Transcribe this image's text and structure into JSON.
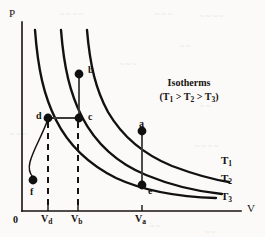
{
  "figure": {
    "axes": {
      "x_label": "V",
      "y_label": "P",
      "origin_label": "0"
    },
    "legend": {
      "title": "Isotherms",
      "relation_prefix": "(T",
      "relation": "(T1 > T2 > T3)",
      "parts": {
        "open": "(T",
        "s1": "1",
        "gt1": " > T",
        "s2": "2",
        "gt2": " > T",
        "s3": "3",
        "close": ")"
      }
    },
    "curve_labels": [
      {
        "base": "T",
        "sub": "1"
      },
      {
        "base": "T",
        "sub": "2"
      },
      {
        "base": "T",
        "sub": "3"
      }
    ],
    "x_ticks": [
      {
        "base": "V",
        "sub": "d"
      },
      {
        "base": "V",
        "sub": "b"
      },
      {
        "base": "V",
        "sub": "a"
      }
    ],
    "points": [
      {
        "id": "a",
        "label": "a"
      },
      {
        "id": "b",
        "label": "b"
      },
      {
        "id": "c",
        "label": "c"
      },
      {
        "id": "d",
        "label": "d"
      },
      {
        "id": "e",
        "label": "e"
      },
      {
        "id": "f",
        "label": "f"
      }
    ],
    "colors": {
      "ink": "#16120f",
      "curve": "#111111",
      "connector": "#444444",
      "background": "#fbfaf8"
    }
  },
  "chart_data": {
    "type": "line",
    "title": "Isotherms",
    "xlabel": "V",
    "ylabel": "P",
    "grid": false,
    "legend_position": "upper-right",
    "annotation": "(T1 > T2 > T3)",
    "xlim": [
      0,
      1
    ],
    "ylim": [
      0,
      1
    ],
    "axis_ticks": {
      "x": [
        "Vd",
        "Vb",
        "Va"
      ],
      "y": []
    },
    "series": [
      {
        "name": "T1",
        "note": "highest isotherm, PV = const (largest constant)",
        "points": [
          {
            "x": 0.295,
            "y": 0.975
          },
          {
            "x": 0.315,
            "y": 0.8
          },
          {
            "x": 0.345,
            "y": 0.69
          },
          {
            "x": 0.4,
            "y": 0.56
          },
          {
            "x": 0.48,
            "y": 0.45
          },
          {
            "x": 0.56,
            "y": 0.38
          },
          {
            "x": 0.66,
            "y": 0.32
          },
          {
            "x": 0.78,
            "y": 0.27
          },
          {
            "x": 0.9,
            "y": 0.24
          },
          {
            "x": 1.0,
            "y": 0.225
          }
        ]
      },
      {
        "name": "T2",
        "note": "middle isotherm",
        "points": [
          {
            "x": 0.175,
            "y": 0.975
          },
          {
            "x": 0.195,
            "y": 0.79
          },
          {
            "x": 0.23,
            "y": 0.64
          },
          {
            "x": 0.28,
            "y": 0.52
          },
          {
            "x": 0.36,
            "y": 0.4
          },
          {
            "x": 0.46,
            "y": 0.31
          },
          {
            "x": 0.58,
            "y": 0.24
          },
          {
            "x": 0.72,
            "y": 0.185
          },
          {
            "x": 0.87,
            "y": 0.15
          },
          {
            "x": 1.0,
            "y": 0.135
          }
        ]
      },
      {
        "name": "T3",
        "note": "lowest isotherm",
        "points": [
          {
            "x": 0.06,
            "y": 0.975
          },
          {
            "x": 0.08,
            "y": 0.76
          },
          {
            "x": 0.11,
            "y": 0.6
          },
          {
            "x": 0.16,
            "y": 0.46
          },
          {
            "x": 0.24,
            "y": 0.33
          },
          {
            "x": 0.34,
            "y": 0.23
          },
          {
            "x": 0.47,
            "y": 0.16
          },
          {
            "x": 0.64,
            "y": 0.11
          },
          {
            "x": 0.82,
            "y": 0.085
          },
          {
            "x": 1.0,
            "y": 0.075
          }
        ]
      }
    ],
    "marked_points": [
      {
        "label": "b",
        "x": 0.262,
        "y": 0.745,
        "on_series": "T1"
      },
      {
        "label": "c",
        "x": 0.262,
        "y": 0.513,
        "on_series": "T2"
      },
      {
        "label": "d",
        "x": 0.124,
        "y": 0.513,
        "on_series": "T3"
      },
      {
        "label": "a",
        "x": 0.57,
        "y": 0.375,
        "on_series": "T1"
      },
      {
        "label": "e",
        "x": 0.57,
        "y": 0.09,
        "on_series": "T3"
      },
      {
        "label": "f",
        "x": 0.06,
        "y": 0.17,
        "on_series": "none"
      }
    ],
    "connectors": [
      {
        "from": "b",
        "to": "c",
        "style": "solid",
        "orientation": "vertical"
      },
      {
        "from": "d",
        "to": "c",
        "style": "solid",
        "orientation": "horizontal"
      },
      {
        "from": "a",
        "to": "e",
        "style": "solid",
        "orientation": "vertical"
      },
      {
        "from": "d",
        "to": "f",
        "style": "solid",
        "orientation": "curved"
      }
    ],
    "dashed_drop_lines": [
      {
        "at_tick": "Vd",
        "x": 0.124
      },
      {
        "at_tick": "Vb",
        "x": 0.262
      }
    ]
  },
  "background_noise": [
    {
      "text": "~ ~  ~   ~",
      "x": 60,
      "y": 10
    },
    {
      "text": "~  ~ ~",
      "x": 155,
      "y": 10
    },
    {
      "text": "~   ~  ~   ~",
      "x": 200,
      "y": 12
    },
    {
      "text": "~  ~",
      "x": 180,
      "y": 42
    },
    {
      "text": "~   ~ ~",
      "x": 120,
      "y": 60
    },
    {
      "text": "~  ~",
      "x": 200,
      "y": 102
    },
    {
      "text": "~   ~  ~",
      "x": 10,
      "y": 130
    },
    {
      "text": "~  ~ ~  ~",
      "x": 195,
      "y": 142
    },
    {
      "text": "~  ~",
      "x": 150,
      "y": 222
    },
    {
      "text": "~   ~",
      "x": 205,
      "y": 228
    }
  ]
}
